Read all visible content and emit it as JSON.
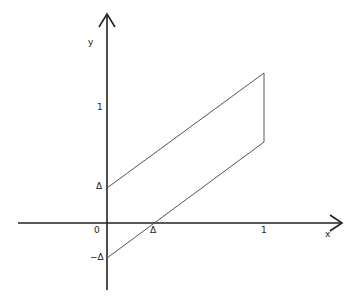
{
  "diagram": {
    "axes": {
      "x_label": "x",
      "y_label": "y"
    },
    "labels": {
      "origin": "0",
      "x_delta": "Δ",
      "x_one": "1",
      "y_one": "1",
      "y_delta": "Δ",
      "y_neg_delta": "−Δ"
    },
    "region": {
      "description": "Parallelogram band between y = x + Δ and y = x − Δ for 0 ≤ x ≤ 1",
      "vertices": [
        [
          0,
          "Δ"
        ],
        [
          1,
          "1+Δ"
        ],
        [
          1,
          "1−Δ"
        ],
        [
          0,
          "−Δ"
        ]
      ]
    },
    "colors": {
      "axis": "#222222",
      "region": "#555555"
    }
  }
}
